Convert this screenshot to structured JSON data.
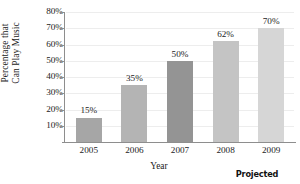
{
  "chart_data": {
    "type": "bar",
    "title": "",
    "categories": [
      "2005",
      "2006",
      "2007",
      "2008",
      "2009"
    ],
    "values": [
      15,
      35,
      50,
      62,
      70
    ],
    "value_labels": [
      "15%",
      "35%",
      "50%",
      "62%",
      "70%"
    ],
    "bar_colors": [
      "#a6a6a6",
      "#b4b4b4",
      "#949494",
      "#c4c4c4",
      "#d6d6d6"
    ],
    "xlabel": "Year",
    "ylabel_lines": [
      "Percentage that",
      "Can Play Music"
    ],
    "ylim": [
      0,
      80
    ],
    "ytick_values": [
      10,
      20,
      30,
      40,
      50,
      60,
      70,
      80
    ],
    "ytick_labels": [
      "10%",
      "20%",
      "30%",
      "40%",
      "50%",
      "60%",
      "70%",
      "80%"
    ],
    "grid": true,
    "legend": false,
    "annotations": [
      {
        "text": "Projected",
        "applies_to": [
          "2008",
          "2009"
        ]
      }
    ]
  },
  "axis": {
    "y_title_line1": "Percentage that",
    "y_title_line2": "Can Play Music",
    "x_title": "Year"
  },
  "annotation": {
    "projected": "Projected"
  }
}
